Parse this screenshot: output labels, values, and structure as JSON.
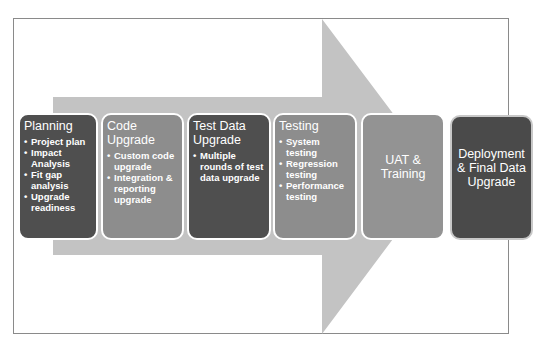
{
  "diagram": {
    "type": "process-arrow",
    "colors": {
      "arrow": "#c3c3c3",
      "dark_box": "#4f4f4f",
      "mid_box": "#8d8d8d",
      "text": "#ffffff"
    },
    "stages": [
      {
        "title": "Planning",
        "bullets": [
          "Project plan",
          "Impact Analysis",
          "Fit gap analysis",
          "Upgrade readiness"
        ]
      },
      {
        "title": "Code Upgrade",
        "bullets": [
          "Custom code upgrade",
          "Integration & reporting upgrade"
        ]
      },
      {
        "title": "Test Data Upgrade",
        "bullets": [
          "Multiple rounds of test data upgrade"
        ]
      },
      {
        "title": "Testing",
        "bullets": [
          "System testing",
          "Regression testing",
          "Performance testing"
        ]
      },
      {
        "title": "UAT & Training",
        "bullets": []
      },
      {
        "title": "Deployment & Final Data Upgrade",
        "bullets": []
      }
    ]
  }
}
